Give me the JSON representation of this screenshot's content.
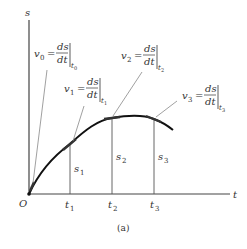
{
  "figure": {
    "caption": "(a)",
    "axes": {
      "y_label": "s",
      "x_label": "t",
      "origin_label": "O"
    },
    "time_ticks": [
      {
        "label": "t",
        "sub": "1"
      },
      {
        "label": "t",
        "sub": "2"
      },
      {
        "label": "t",
        "sub": "3"
      }
    ],
    "position_labels": [
      {
        "label": "s",
        "sub": "1"
      },
      {
        "label": "s",
        "sub": "2"
      },
      {
        "label": "s",
        "sub": "3"
      }
    ],
    "velocity_annotations": [
      {
        "v": "v",
        "v_sub": "0",
        "eq": "=",
        "num": "ds",
        "den": "dt",
        "eval_sub": "t",
        "eval_subsub": "0"
      },
      {
        "v": "v",
        "v_sub": "1",
        "eq": "=",
        "num": "ds",
        "den": "dt",
        "eval_sub": "t",
        "eval_subsub": "1"
      },
      {
        "v": "v",
        "v_sub": "2",
        "eq": "=",
        "num": "ds",
        "den": "dt",
        "eval_sub": "t",
        "eval_subsub": "2"
      },
      {
        "v": "v",
        "v_sub": "3",
        "eq": "=",
        "num": "ds",
        "den": "dt",
        "eval_sub": "t",
        "eval_subsub": "3"
      }
    ],
    "colors": {
      "curve": "#111111",
      "axes": "#444444",
      "leaders": "#888888",
      "text": "#333333"
    }
  }
}
